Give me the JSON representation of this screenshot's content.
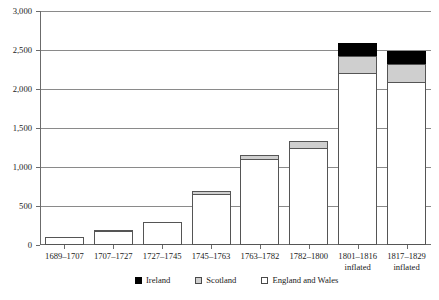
{
  "chart_data": {
    "type": "bar",
    "title": "",
    "xlabel": "",
    "ylabel": "",
    "ylim": [
      0,
      3000
    ],
    "ytick_values": [
      0,
      500,
      1000,
      1500,
      2000,
      2500,
      3000
    ],
    "ytick_labels": [
      "0",
      "500",
      "1,000",
      "1,500",
      "2,000",
      "2,500",
      "3,000"
    ],
    "grid": true,
    "stacked": true,
    "legend_position": "bottom",
    "categories": [
      "1689–1707",
      "1707–1727",
      "1727–1745",
      "1745–1763",
      "1763–1782",
      "1782–1800",
      "1801–1816",
      "1817–1829"
    ],
    "category_sublabels": [
      "",
      "",
      "",
      "",
      "",
      "",
      "inflated",
      "inflated"
    ],
    "series": [
      {
        "name": "England and Wales",
        "color": "#ffffff",
        "values": [
          100,
          175,
          295,
          655,
          1100,
          1245,
          2205,
          2095
        ]
      },
      {
        "name": "Scotland",
        "color": "#cfcfcf",
        "values": [
          0,
          30,
          0,
          50,
          65,
          100,
          235,
          245
        ]
      },
      {
        "name": "Ireland",
        "color": "#000000",
        "values": [
          0,
          0,
          0,
          0,
          0,
          0,
          180,
          170
        ]
      }
    ],
    "totals": [
      100,
      205,
      295,
      705,
      1165,
      1345,
      2620,
      2510
    ]
  },
  "legend": {
    "items": [
      {
        "label": "Ireland",
        "swatch": "ireland"
      },
      {
        "label": "Scotland",
        "swatch": "scotland"
      },
      {
        "label": "England and Wales",
        "swatch": "england"
      }
    ]
  }
}
